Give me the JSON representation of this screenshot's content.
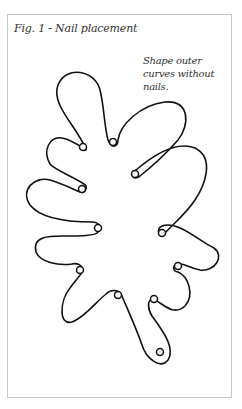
{
  "figure": {
    "title": "Fig. 1 - Nail placement",
    "note": "Shape outer curves without nails.",
    "line_color": "#111111",
    "frame_color": "#c8c8c8",
    "nail_count": 11,
    "nails": [
      {
        "x": 83,
        "y": 147
      },
      {
        "x": 113,
        "y": 142
      },
      {
        "x": 135,
        "y": 174
      },
      {
        "x": 162,
        "y": 233
      },
      {
        "x": 178,
        "y": 266
      },
      {
        "x": 154,
        "y": 299
      },
      {
        "x": 160,
        "y": 352
      },
      {
        "x": 118,
        "y": 295
      },
      {
        "x": 80,
        "y": 270
      },
      {
        "x": 98,
        "y": 228
      },
      {
        "x": 82,
        "y": 189
      }
    ]
  }
}
